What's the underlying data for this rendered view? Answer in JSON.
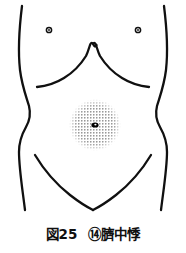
{
  "figure": {
    "caption_figure_label": "図25",
    "caption_point_number": "⑭",
    "caption_point_name": "臍中悸",
    "background_color": "#ffffff",
    "line_color": "#101010"
  },
  "illustration": {
    "subject": "human-torso-abdomen-anterior-view",
    "line_color": "#101010",
    "stipple_color": "#1a1a1a",
    "navel_color": "#000000",
    "parts": {
      "left_body_outline": "left lateral torso contour",
      "right_body_outline": "right lateral torso contour",
      "costal_margin": "rib cage arch with xiphoid notch",
      "inguinal_lines": "groin V lines",
      "left_nipple": "small circle",
      "right_nipple": "small circle",
      "navel": "umbilicus dark oval",
      "stipple_region": "dotted circular palpation area around navel"
    },
    "geometry": {
      "left_nipple_cx": 49,
      "left_nipple_cy": 30,
      "right_nipple_cx": 138,
      "right_nipple_cy": 30,
      "nipple_outer_r": 2.6,
      "nipple_inner_r": 1.1,
      "navel_cx": 95,
      "navel_cy": 125,
      "navel_rx": 3.4,
      "navel_ry": 2.4,
      "stipple_cx": 95,
      "stipple_cy": 125,
      "stipple_r": 26
    }
  }
}
